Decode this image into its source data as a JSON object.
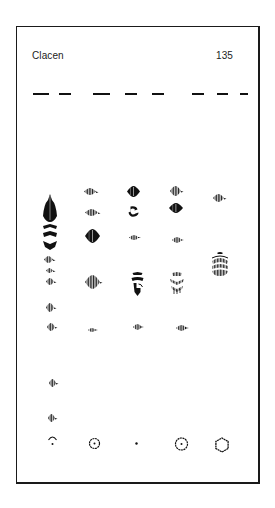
{
  "page": {
    "title": "Clacen",
    "page_number": "135"
  },
  "dashes": [
    {
      "x": 33,
      "w": 16
    },
    {
      "x": 59,
      "w": 12
    },
    {
      "x": 93,
      "w": 17
    },
    {
      "x": 125,
      "w": 12
    },
    {
      "x": 152,
      "w": 12
    },
    {
      "x": 192,
      "w": 12
    },
    {
      "x": 217,
      "w": 11
    },
    {
      "x": 240,
      "w": 8
    }
  ],
  "glyphs": [
    {
      "type": "tall-stack",
      "x": 50,
      "y": 222,
      "w": 14,
      "h": 56
    },
    {
      "type": "lozenge",
      "x": 48,
      "y": 259,
      "w": 9,
      "h": 7
    },
    {
      "type": "lozenge",
      "x": 49,
      "y": 270,
      "w": 7,
      "h": 5
    },
    {
      "type": "lozenge",
      "x": 50,
      "y": 281,
      "w": 8,
      "h": 7
    },
    {
      "type": "lozenge",
      "x": 50,
      "y": 307,
      "w": 8,
      "h": 9
    },
    {
      "type": "lozenge",
      "x": 51,
      "y": 327,
      "w": 8,
      "h": 8
    },
    {
      "type": "lozenge",
      "x": 52,
      "y": 383,
      "w": 7,
      "h": 8
    },
    {
      "type": "lozenge",
      "x": 51,
      "y": 418,
      "w": 7,
      "h": 8
    },
    {
      "type": "arc-dot",
      "x": 52,
      "y": 441,
      "w": 9,
      "h": 10
    },
    {
      "type": "lozenge",
      "x": 90,
      "y": 191,
      "w": 12,
      "h": 7
    },
    {
      "type": "lozenge",
      "x": 91,
      "y": 212,
      "w": 13,
      "h": 7
    },
    {
      "type": "lozenge-solid",
      "x": 92,
      "y": 236,
      "w": 15,
      "h": 14
    },
    {
      "type": "lozenge",
      "x": 92,
      "y": 282,
      "w": 15,
      "h": 14
    },
    {
      "type": "lozenge-small",
      "x": 92,
      "y": 330,
      "w": 8,
      "h": 4
    },
    {
      "type": "circle-dot",
      "x": 94,
      "y": 443,
      "w": 11,
      "h": 11
    },
    {
      "type": "lozenge-solid",
      "x": 133,
      "y": 191,
      "w": 13,
      "h": 11
    },
    {
      "type": "swirl",
      "x": 133,
      "y": 211,
      "w": 11,
      "h": 11
    },
    {
      "type": "lozenge-small",
      "x": 134,
      "y": 237,
      "w": 10,
      "h": 5
    },
    {
      "type": "stacked-t",
      "x": 137,
      "y": 284,
      "w": 13,
      "h": 24
    },
    {
      "type": "lozenge-small",
      "x": 137,
      "y": 327,
      "w": 9,
      "h": 6
    },
    {
      "type": "dot",
      "x": 136,
      "y": 443,
      "w": 3,
      "h": 3
    },
    {
      "type": "lozenge",
      "x": 175,
      "y": 191,
      "w": 11,
      "h": 10
    },
    {
      "type": "lozenge-solid",
      "x": 176,
      "y": 208,
      "w": 14,
      "h": 10
    },
    {
      "type": "lozenge-small",
      "x": 177,
      "y": 240,
      "w": 10,
      "h": 6
    },
    {
      "type": "stacked-v",
      "x": 177,
      "y": 283,
      "w": 14,
      "h": 22
    },
    {
      "type": "lozenge-small",
      "x": 181,
      "y": 328,
      "w": 11,
      "h": 6
    },
    {
      "type": "circle-dot",
      "x": 181,
      "y": 444,
      "w": 13,
      "h": 12
    },
    {
      "type": "lozenge",
      "x": 218,
      "y": 198,
      "w": 11,
      "h": 8
    },
    {
      "type": "stacked-dome",
      "x": 220,
      "y": 264,
      "w": 18,
      "h": 24
    },
    {
      "type": "hexagon",
      "x": 222,
      "y": 445,
      "w": 14,
      "h": 14
    }
  ],
  "colors": {
    "ink": "#111111",
    "frame": "#1a1a1a",
    "paper": "#ffffff"
  }
}
